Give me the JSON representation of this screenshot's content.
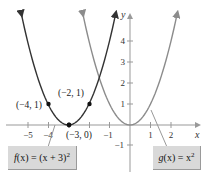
{
  "chart_data": {
    "type": "line",
    "title": "",
    "xlabel": "x",
    "ylabel": "y",
    "xlim": [
      -5.5,
      3.3
    ],
    "ylim": [
      -1.5,
      5
    ],
    "grid": false,
    "x_ticks": [
      -5,
      -4,
      -1,
      1,
      2
    ],
    "x_tick_labels": [
      "−5",
      "−4",
      "−1",
      "1",
      "2"
    ],
    "y_ticks": [
      -1,
      1,
      2,
      3,
      4
    ],
    "y_tick_labels": [
      "−1",
      "1",
      "2",
      "3",
      "4"
    ],
    "series": [
      {
        "name": "f(x) = (x + 3)^2",
        "expr": "(x+3)^2",
        "color": "#333333",
        "x_range": [
          -5.3,
          -0.7
        ]
      },
      {
        "name": "g(x) = x^2",
        "expr": "x^2",
        "color": "#8c8c8c",
        "x_range": [
          -2.3,
          2.3
        ]
      }
    ],
    "points": [
      {
        "x": -4,
        "y": 1,
        "label": "(−4, 1)"
      },
      {
        "x": -2,
        "y": 1,
        "label": "(−2, 1)"
      },
      {
        "x": -3,
        "y": 0,
        "label": "(−3, 0)"
      }
    ],
    "legend": [
      {
        "label_main": "f(x) = (x + 3)",
        "sup": "2",
        "position": "bottom-left"
      },
      {
        "label_main": "g(x) = x",
        "sup": "2",
        "position": "bottom-right"
      }
    ]
  },
  "labels": {
    "x_axis": "x",
    "y_axis": "y",
    "f_func": "f",
    "f_rest": "(x) = (x + 3)",
    "f_sup": "2",
    "g_func": "g",
    "g_rest": "(x) = x",
    "g_sup": "2",
    "pt1": "(−4, 1)",
    "pt2": "(−2, 1)",
    "pt3": "(−3, 0)"
  }
}
